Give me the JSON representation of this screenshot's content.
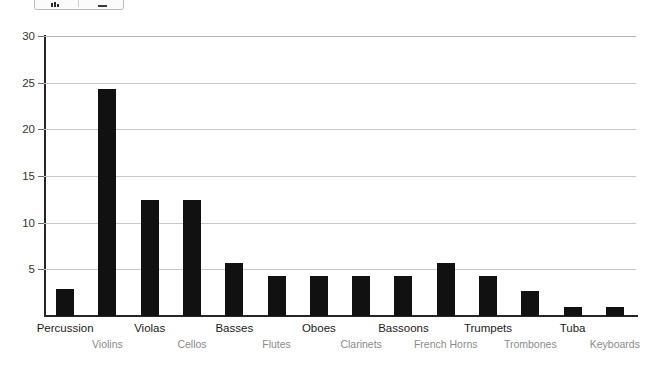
{
  "toolbar": {
    "chart_icon": "bar-chart-icon",
    "line_icon": "horizontal-line-icon"
  },
  "chart_data": {
    "type": "bar",
    "title": "",
    "subtitle": "",
    "xlabel": "",
    "ylabel": "",
    "ylim": [
      0,
      30
    ],
    "yticks": [
      5,
      10,
      15,
      20,
      25,
      30
    ],
    "ytick_labels": [
      "5",
      "10",
      "15",
      "20",
      "25",
      "30"
    ],
    "grid": true,
    "legend": "none",
    "bar_color": "#111111",
    "grid_color": "#c8c8c8",
    "axis_color": "#262626",
    "categories": [
      "Percussion",
      "Violins",
      "Violas",
      "Cellos",
      "Basses",
      "Flutes",
      "Oboes",
      "Clarinets",
      "Bassoons",
      "French Horns",
      "Trumpets",
      "Trombones",
      "Tuba",
      "Keyboards"
    ],
    "values": [
      2.9,
      24.3,
      12.4,
      12.4,
      5.7,
      4.3,
      4.3,
      4.3,
      4.3,
      5.7,
      4.3,
      2.7,
      1.0,
      1.0
    ]
  }
}
